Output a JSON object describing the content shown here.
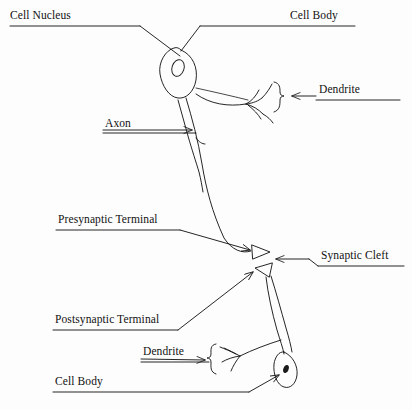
{
  "figure": {
    "style": "hand-drawn line art, scanned",
    "background_color": "#fdfdfd",
    "ink_color": "#1a1a1a"
  },
  "labels": [
    {
      "id": "cell-nucleus",
      "text": "Cell Nucleus",
      "x": 10,
      "y": 16
    },
    {
      "id": "cell-body-top",
      "text": "Cell Body",
      "x": 290,
      "y": 16
    },
    {
      "id": "dendrite-top",
      "text": "Dendrite",
      "x": 318,
      "y": 90
    },
    {
      "id": "axon",
      "text": "Axon",
      "x": 105,
      "y": 123
    },
    {
      "id": "presynaptic-terminal",
      "text": "Presynaptic Terminal",
      "x": 58,
      "y": 219
    },
    {
      "id": "synaptic-cleft",
      "text": "Synaptic Cleft",
      "x": 320,
      "y": 255
    },
    {
      "id": "postsynaptic-terminal",
      "text": "Postsynaptic Terminal",
      "x": 55,
      "y": 319
    },
    {
      "id": "dendrite-bottom",
      "text": "Dendrite",
      "x": 143,
      "y": 352
    },
    {
      "id": "cell-body-bottom",
      "text": "Cell Body",
      "x": 55,
      "y": 381
    }
  ],
  "structures": {
    "presynaptic_neuron": {
      "soma": "elongated tilted ellipse",
      "nucleus": "small open ellipse inside soma",
      "dendrite": "branching twigs to the right of soma",
      "axon": "long wavy double-line shaft descending",
      "terminal": "triangular presynaptic bouton"
    },
    "postsynaptic_neuron": {
      "terminal": "triangular postsynaptic bouton",
      "dendrite": "branching twigs",
      "soma": "small leaf-shaped ellipse",
      "nucleus": "small filled dark spot"
    },
    "synaptic_cleft": "narrow gap between the two triangular terminals"
  }
}
